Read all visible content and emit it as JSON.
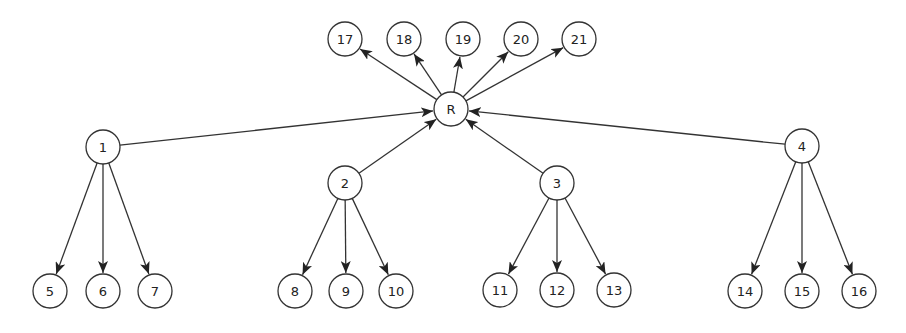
{
  "diagram": {
    "type": "directed-graph",
    "node_radius": 17,
    "colors": {
      "stroke": "#333333",
      "fill": "#ffffff",
      "text": "#222222",
      "background": "#ffffff"
    },
    "nodes": [
      {
        "id": "R",
        "label": "R",
        "x": 451,
        "y": 109
      },
      {
        "id": "17",
        "label": "17",
        "x": 345,
        "y": 39
      },
      {
        "id": "18",
        "label": "18",
        "x": 404,
        "y": 39
      },
      {
        "id": "19",
        "label": "19",
        "x": 463,
        "y": 39
      },
      {
        "id": "20",
        "label": "20",
        "x": 521,
        "y": 39
      },
      {
        "id": "21",
        "label": "21",
        "x": 579,
        "y": 39
      },
      {
        "id": "1",
        "label": "1",
        "x": 103,
        "y": 147
      },
      {
        "id": "2",
        "label": "2",
        "x": 345,
        "y": 183
      },
      {
        "id": "3",
        "label": "3",
        "x": 557,
        "y": 183
      },
      {
        "id": "4",
        "label": "4",
        "x": 802,
        "y": 146
      },
      {
        "id": "5",
        "label": "5",
        "x": 50,
        "y": 291
      },
      {
        "id": "6",
        "label": "6",
        "x": 103,
        "y": 291
      },
      {
        "id": "7",
        "label": "7",
        "x": 155,
        "y": 291
      },
      {
        "id": "8",
        "label": "8",
        "x": 295,
        "y": 291
      },
      {
        "id": "9",
        "label": "9",
        "x": 346,
        "y": 291
      },
      {
        "id": "10",
        "label": "10",
        "x": 396,
        "y": 291
      },
      {
        "id": "11",
        "label": "11",
        "x": 500,
        "y": 290
      },
      {
        "id": "12",
        "label": "12",
        "x": 557,
        "y": 290
      },
      {
        "id": "13",
        "label": "13",
        "x": 614,
        "y": 290
      },
      {
        "id": "14",
        "label": "14",
        "x": 745,
        "y": 291
      },
      {
        "id": "15",
        "label": "15",
        "x": 802,
        "y": 291
      },
      {
        "id": "16",
        "label": "16",
        "x": 859,
        "y": 291
      }
    ],
    "edges": [
      {
        "from": "R",
        "to": "17"
      },
      {
        "from": "R",
        "to": "18"
      },
      {
        "from": "R",
        "to": "19"
      },
      {
        "from": "R",
        "to": "20"
      },
      {
        "from": "R",
        "to": "21"
      },
      {
        "from": "1",
        "to": "R"
      },
      {
        "from": "2",
        "to": "R"
      },
      {
        "from": "3",
        "to": "R"
      },
      {
        "from": "4",
        "to": "R"
      },
      {
        "from": "1",
        "to": "5"
      },
      {
        "from": "1",
        "to": "6"
      },
      {
        "from": "1",
        "to": "7"
      },
      {
        "from": "2",
        "to": "8"
      },
      {
        "from": "2",
        "to": "9"
      },
      {
        "from": "2",
        "to": "10"
      },
      {
        "from": "3",
        "to": "11"
      },
      {
        "from": "3",
        "to": "12"
      },
      {
        "from": "3",
        "to": "13"
      },
      {
        "from": "4",
        "to": "14"
      },
      {
        "from": "4",
        "to": "15"
      },
      {
        "from": "4",
        "to": "16"
      }
    ]
  }
}
